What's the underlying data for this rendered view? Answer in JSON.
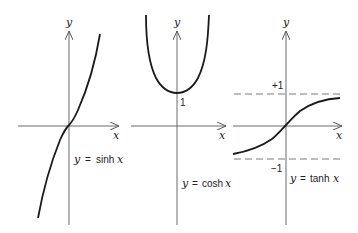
{
  "figure": {
    "panels": [
      {
        "name": "sinh",
        "y_axis_label": "y",
        "x_axis_label": "x",
        "caption": {
          "y": "y",
          "eq": "=",
          "fn": "sinh",
          "x": "x"
        }
      },
      {
        "name": "cosh",
        "y_axis_label": "y",
        "x_axis_label": "x",
        "intercept_label": "1",
        "caption": {
          "y": "y",
          "eq": "=",
          "fn": "cosh",
          "x": "x"
        }
      },
      {
        "name": "tanh",
        "y_axis_label": "y",
        "x_axis_label": "x",
        "upper_asymptote_label": "+1",
        "lower_asymptote_label": "−1",
        "caption": {
          "y": "y",
          "eq": "=",
          "fn": "tanh",
          "x": "x"
        }
      }
    ],
    "colors": {
      "curve": "#1a1a1a",
      "axis": "#6b6b6b",
      "dashed": "#7a7a7a",
      "background": "#ffffff"
    }
  }
}
